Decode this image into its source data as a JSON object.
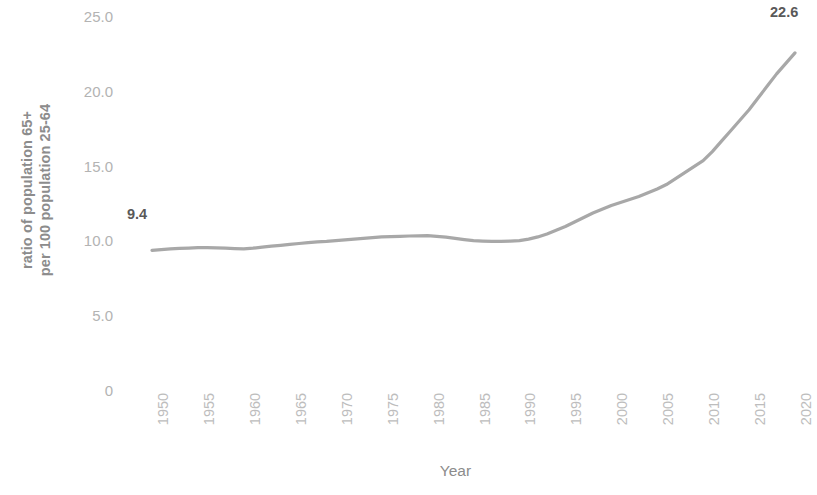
{
  "chart_data": {
    "type": "line",
    "title": "",
    "xlabel": "Year",
    "ylabel": "ratio of population 65+ per 100 population 25-64",
    "ylabel_line1": "ratio of population 65+",
    "ylabel_line2": "per 100 population 25-64",
    "x": [
      1950,
      1951,
      1952,
      1953,
      1954,
      1955,
      1956,
      1957,
      1958,
      1959,
      1960,
      1961,
      1962,
      1963,
      1964,
      1965,
      1966,
      1967,
      1968,
      1969,
      1970,
      1971,
      1972,
      1973,
      1974,
      1975,
      1976,
      1977,
      1978,
      1979,
      1980,
      1981,
      1982,
      1983,
      1984,
      1985,
      1986,
      1987,
      1988,
      1989,
      1990,
      1991,
      1992,
      1993,
      1994,
      1995,
      1996,
      1997,
      1998,
      1999,
      2000,
      2001,
      2002,
      2003,
      2004,
      2005,
      2006,
      2007,
      2008,
      2009,
      2010,
      2011,
      2012,
      2013,
      2014,
      2015,
      2016,
      2017,
      2018,
      2019,
      2020
    ],
    "values": [
      9.4,
      9.45,
      9.5,
      9.53,
      9.55,
      9.58,
      9.58,
      9.57,
      9.55,
      9.52,
      9.5,
      9.55,
      9.62,
      9.68,
      9.74,
      9.8,
      9.86,
      9.92,
      9.97,
      10.0,
      10.05,
      10.1,
      10.15,
      10.2,
      10.25,
      10.3,
      10.32,
      10.34,
      10.36,
      10.37,
      10.38,
      10.34,
      10.28,
      10.2,
      10.12,
      10.05,
      10.02,
      10.0,
      10.0,
      10.02,
      10.05,
      10.15,
      10.3,
      10.5,
      10.75,
      11.0,
      11.3,
      11.6,
      11.9,
      12.15,
      12.4,
      12.6,
      12.8,
      13.0,
      13.25,
      13.5,
      13.8,
      14.2,
      14.6,
      15.0,
      15.4,
      16.0,
      16.7,
      17.4,
      18.1,
      18.8,
      19.6,
      20.4,
      21.2,
      21.9,
      22.6
    ],
    "xlim": [
      1950,
      2020
    ],
    "ylim": [
      0,
      25
    ],
    "y_ticks": [
      "25.0",
      "20.0",
      "15.0",
      "10.0",
      "5.0",
      "0"
    ],
    "y_tick_values": [
      25,
      20,
      15,
      10,
      5,
      0
    ],
    "x_ticks": [
      "1950",
      "1955",
      "1960",
      "1965",
      "1970",
      "1975",
      "1980",
      "1985",
      "1990",
      "1995",
      "2000",
      "2005",
      "2010",
      "2015",
      "2020"
    ],
    "x_tick_values": [
      1950,
      1955,
      1960,
      1965,
      1970,
      1975,
      1980,
      1985,
      1990,
      1995,
      2000,
      2005,
      2010,
      2015,
      2020
    ],
    "grid": false,
    "legend": false,
    "line_color": "#a8a8a8",
    "label_color": "#595959",
    "tick_color": "#b8b8b8",
    "axis_title_color": "#8c8c8c",
    "point_labels": [
      {
        "text": "9.4",
        "year": 1950,
        "value": 9.4
      },
      {
        "text": "22.6",
        "year": 2020,
        "value": 22.6
      }
    ]
  }
}
